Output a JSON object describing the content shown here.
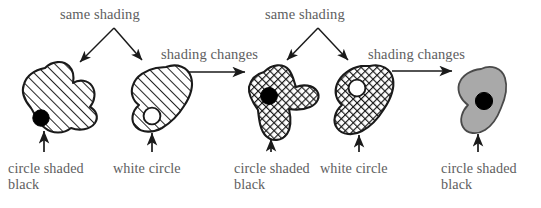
{
  "figure": {
    "background_color": "#ffffff",
    "text_color": "#5e5e60",
    "ink_color": "#1a1a1a",
    "gray_fill": "#a9a9a9",
    "annotations": {
      "same_shading_1": "same shading",
      "same_shading_2": "same shading",
      "shading_changes_1": "shading changes",
      "shading_changes_2": "shading changes"
    },
    "shapes": [
      {
        "id": "shape-1",
        "name": "hatched-blob-black-circle",
        "fill_pattern": "diagonal-hatch",
        "circle": "black",
        "caption": "circle shaded\nblack"
      },
      {
        "id": "shape-2",
        "name": "hatched-bean-white-circle",
        "fill_pattern": "diagonal-hatch",
        "circle": "white",
        "caption": "white circle"
      },
      {
        "id": "shape-3",
        "name": "crosshatched-blob-black-circle",
        "fill_pattern": "cross-hatch",
        "circle": "black",
        "caption": "circle shaded\nblack"
      },
      {
        "id": "shape-4",
        "name": "crosshatched-bean-white-circle",
        "fill_pattern": "cross-hatch",
        "circle": "white",
        "caption": "white circle"
      },
      {
        "id": "shape-5",
        "name": "gray-blob-black-circle",
        "fill_pattern": "solid-gray",
        "circle": "black",
        "caption": "circle shaded\nblack"
      }
    ]
  }
}
